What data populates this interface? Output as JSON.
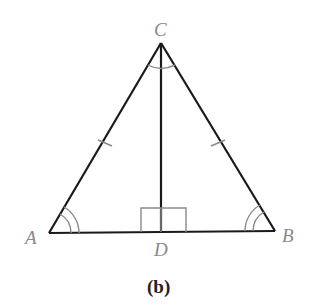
{
  "figure": {
    "caption": "(b)",
    "vertices": {
      "A": {
        "label": "A",
        "x": 49,
        "y": 233
      },
      "B": {
        "label": "B",
        "x": 275,
        "y": 231
      },
      "C": {
        "label": "C",
        "x": 161,
        "y": 43
      },
      "D": {
        "label": "D",
        "x": 161,
        "y": 232
      }
    },
    "markings": {
      "equal_sides": [
        "AC",
        "BC"
      ],
      "equal_angles_double_arc": [
        "A",
        "B"
      ],
      "bisected_angle_single_arc": "C",
      "right_angle_at": "D"
    },
    "colors": {
      "lines": "#1a1a1a",
      "marks": "#8a8a8a",
      "labels": "#8a8a8a"
    }
  }
}
